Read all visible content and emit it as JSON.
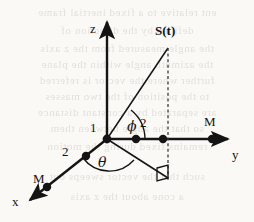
{
  "figure": {
    "background_color": "#faf9f6",
    "ink_color": "#141414",
    "width": 254,
    "height": 222
  },
  "axes": {
    "z": {
      "label": "z",
      "x": 96,
      "y": 22
    },
    "y": {
      "label": "y",
      "x": 233,
      "y": 152
    },
    "x": {
      "label": "x",
      "x": 15,
      "y": 199
    }
  },
  "vector": {
    "label": "S(t)",
    "label_x": 156,
    "label_y": 28,
    "tip_x": 168,
    "tip_y": 48
  },
  "angles": {
    "phi": {
      "symbol": "ϕ",
      "x": 128,
      "y": 120
    },
    "theta": {
      "symbol": "θ",
      "x": 99,
      "y": 159
    }
  },
  "markers": {
    "unit_z": {
      "label": "1",
      "x": 89,
      "y": 122
    },
    "unit_y": {
      "label": "2",
      "x": 140,
      "y": 117
    },
    "unit_x": {
      "label": "2",
      "x": 62,
      "y": 146
    },
    "mass_y": {
      "label": "M",
      "x": 204,
      "y": 117
    },
    "mass_x": {
      "label": "M",
      "x": 34,
      "y": 174
    }
  },
  "bleed_text": {
    "opacity": 0.17,
    "lines": [
      {
        "text": "ent relative to a fixed inertial frame",
        "y": 12
      },
      {
        "text": "defined by the direction of",
        "y": 30
      },
      {
        "text": "the angle measured from the z axis",
        "y": 48
      },
      {
        "text": "the azimuth angle within the plane",
        "y": 64
      },
      {
        "text": "further where the vector is  referred",
        "y": 80
      },
      {
        "text": "to the position of the two masses",
        "y": 96
      },
      {
        "text": "are separated by a constant distance",
        "y": 112
      },
      {
        "text": "so that the angle between them",
        "y": 128
      },
      {
        "text": "remains fixed during the motion",
        "y": 146
      },
      {
        "text": "such that the vector sweeps out",
        "y": 176
      },
      {
        "text": "a cone about the z axis",
        "y": 196
      }
    ]
  },
  "geometry_points": {
    "origin": {
      "x": 107,
      "y": 139
    },
    "y_axis_dots": [
      136,
      163,
      212
    ],
    "x_axis_dots": [
      {
        "x": 86,
        "y": 156
      },
      {
        "x": 47,
        "y": 187
      }
    ],
    "projection_foot": {
      "x": 168,
      "y": 178
    }
  }
}
